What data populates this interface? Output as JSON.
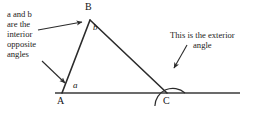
{
  "figure": {
    "background_color": "#ffffff",
    "line_color": "#2b2b2b",
    "text_color": "#1c1c1c"
  },
  "annotations": {
    "left_note": {
      "lines": [
        "a and b",
        "are the",
        "interior",
        "opposite",
        "angles"
      ],
      "full_text": "a and b are the interior opposite angles"
    },
    "right_note": {
      "line1": "This is the exterior",
      "line2": "angle",
      "full_text": "This is the exterior angle"
    }
  },
  "vertices": {
    "A": {
      "label": "A",
      "x": 62,
      "y": 93
    },
    "B": {
      "label": "B",
      "x": 90,
      "y": 20
    },
    "C": {
      "label": "C",
      "x": 167,
      "y": 93
    }
  },
  "angle_labels": {
    "a": "a",
    "b": "b"
  },
  "baseline": {
    "start_x": 55,
    "end_x": 240,
    "y": 93
  },
  "exterior_arc": {
    "center_x": 167,
    "center_y": 93,
    "radius": 18
  },
  "pointers": [
    {
      "name": "pointer-to-angle-b",
      "from_x": 38,
      "from_y": 29,
      "to_x": 84,
      "to_y": 22
    },
    {
      "name": "pointer-to-angle-a",
      "from_x": 42,
      "from_y": 62,
      "to_x": 66,
      "to_y": 84
    },
    {
      "name": "pointer-to-exterior-arc",
      "from_x": 186,
      "from_y": 46,
      "to_x": 173,
      "to_y": 69
    }
  ]
}
